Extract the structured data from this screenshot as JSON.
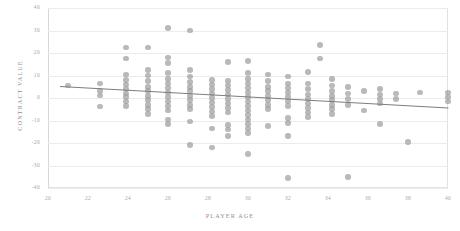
{
  "chart_data": {
    "type": "scatter",
    "title": "",
    "xlabel": "PLAYER AGE",
    "ylabel": "CONTRACT VALUE",
    "xlim": [
      20,
      40
    ],
    "ylim": [
      -40,
      40
    ],
    "xticks": [
      20,
      22,
      24,
      26,
      28,
      30,
      32,
      34,
      36,
      38,
      40
    ],
    "yticks": [
      40,
      30,
      20,
      10,
      0,
      -10,
      -20,
      -30,
      -40
    ],
    "grid": true,
    "legend": "none",
    "marker_color": "#9e9e9e",
    "trendline_color": "#7d7d7d",
    "gridline_color": "#ececec",
    "trendline": {
      "x0": 20.6,
      "y0": 5.2,
      "x1": 40.0,
      "y1": -4.4
    },
    "points": [
      [
        21.0,
        5.5
      ],
      [
        22.6,
        6.5
      ],
      [
        22.6,
        3.2
      ],
      [
        22.6,
        1.2
      ],
      [
        22.6,
        -3.8
      ],
      [
        23.9,
        22.5
      ],
      [
        23.9,
        17.5
      ],
      [
        23.9,
        10.5
      ],
      [
        23.9,
        8.0
      ],
      [
        23.9,
        6.0
      ],
      [
        23.9,
        4.0
      ],
      [
        23.9,
        2.0
      ],
      [
        23.9,
        0.5
      ],
      [
        23.9,
        -1.5
      ],
      [
        23.9,
        -3.5
      ],
      [
        25.0,
        22.5
      ],
      [
        25.0,
        12.5
      ],
      [
        25.0,
        10.0
      ],
      [
        25.0,
        7.5
      ],
      [
        25.0,
        5.0
      ],
      [
        25.0,
        3.0
      ],
      [
        25.0,
        1.0
      ],
      [
        25.0,
        -1.0
      ],
      [
        25.0,
        -3.0
      ],
      [
        25.0,
        -5.0
      ],
      [
        25.0,
        -7.0
      ],
      [
        26.0,
        31.0
      ],
      [
        26.0,
        18.0
      ],
      [
        26.0,
        15.5
      ],
      [
        26.0,
        11.0
      ],
      [
        26.0,
        8.5
      ],
      [
        26.0,
        6.5
      ],
      [
        26.0,
        4.5
      ],
      [
        26.0,
        2.5
      ],
      [
        26.0,
        0.5
      ],
      [
        26.0,
        -1.5
      ],
      [
        26.0,
        -3.5
      ],
      [
        26.0,
        -5.5
      ],
      [
        26.0,
        -9.5
      ],
      [
        26.0,
        -11.5
      ],
      [
        27.1,
        30.0
      ],
      [
        27.1,
        12.5
      ],
      [
        27.1,
        9.5
      ],
      [
        27.1,
        7.0
      ],
      [
        27.1,
        5.0
      ],
      [
        27.1,
        3.0
      ],
      [
        27.1,
        1.0
      ],
      [
        27.1,
        -1.0
      ],
      [
        27.1,
        -3.0
      ],
      [
        27.1,
        -5.0
      ],
      [
        27.1,
        -10.5
      ],
      [
        27.1,
        -21.0
      ],
      [
        28.2,
        8.0
      ],
      [
        28.2,
        6.0
      ],
      [
        28.2,
        4.0
      ],
      [
        28.2,
        2.0
      ],
      [
        28.2,
        0.0
      ],
      [
        28.2,
        -2.0
      ],
      [
        28.2,
        -4.0
      ],
      [
        28.2,
        -6.0
      ],
      [
        28.2,
        -8.0
      ],
      [
        28.2,
        -13.5
      ],
      [
        28.2,
        -22.0
      ],
      [
        29.0,
        16.0
      ],
      [
        29.0,
        7.5
      ],
      [
        29.0,
        5.5
      ],
      [
        29.0,
        3.5
      ],
      [
        29.0,
        1.5
      ],
      [
        29.0,
        -0.5
      ],
      [
        29.0,
        -2.5
      ],
      [
        29.0,
        -4.5
      ],
      [
        29.0,
        -6.5
      ],
      [
        29.0,
        -12.0
      ],
      [
        29.0,
        -14.0
      ],
      [
        29.0,
        -17.0
      ],
      [
        30.0,
        16.5
      ],
      [
        30.0,
        11.0
      ],
      [
        30.0,
        8.5
      ],
      [
        30.0,
        6.5
      ],
      [
        30.0,
        4.5
      ],
      [
        30.0,
        2.5
      ],
      [
        30.0,
        0.5
      ],
      [
        30.0,
        -1.5
      ],
      [
        30.0,
        -3.5
      ],
      [
        30.0,
        -5.5
      ],
      [
        30.0,
        -7.5
      ],
      [
        30.0,
        -9.5
      ],
      [
        30.0,
        -11.5
      ],
      [
        30.0,
        -13.5
      ],
      [
        30.0,
        -15.5
      ],
      [
        30.0,
        -25.0
      ],
      [
        31.0,
        10.5
      ],
      [
        31.0,
        7.5
      ],
      [
        31.0,
        5.0
      ],
      [
        31.0,
        3.0
      ],
      [
        31.0,
        1.0
      ],
      [
        31.0,
        -1.0
      ],
      [
        31.0,
        -3.0
      ],
      [
        31.0,
        -5.0
      ],
      [
        31.0,
        -12.5
      ],
      [
        32.0,
        9.5
      ],
      [
        32.0,
        6.5
      ],
      [
        32.0,
        4.5
      ],
      [
        32.0,
        2.5
      ],
      [
        32.0,
        0.5
      ],
      [
        32.0,
        -1.5
      ],
      [
        32.0,
        -3.5
      ],
      [
        32.0,
        -9.0
      ],
      [
        32.0,
        -11.0
      ],
      [
        32.0,
        -17.0
      ],
      [
        32.0,
        -35.5
      ],
      [
        33.0,
        11.5
      ],
      [
        33.0,
        6.5
      ],
      [
        33.0,
        4.0
      ],
      [
        33.0,
        1.5
      ],
      [
        33.0,
        -0.5
      ],
      [
        33.0,
        -2.5
      ],
      [
        33.0,
        -4.5
      ],
      [
        33.0,
        -6.5
      ],
      [
        33.0,
        -8.5
      ],
      [
        33.6,
        23.5
      ],
      [
        33.6,
        17.5
      ],
      [
        34.2,
        8.5
      ],
      [
        34.2,
        5.5
      ],
      [
        34.2,
        3.0
      ],
      [
        34.2,
        1.0
      ],
      [
        34.2,
        -1.0
      ],
      [
        34.2,
        -3.0
      ],
      [
        34.2,
        -5.0
      ],
      [
        34.2,
        -7.0
      ],
      [
        35.0,
        5.0
      ],
      [
        35.0,
        2.0
      ],
      [
        35.0,
        -0.5
      ],
      [
        35.0,
        -3.0
      ],
      [
        35.0,
        -35.0
      ],
      [
        35.8,
        3.0
      ],
      [
        35.8,
        -5.5
      ],
      [
        36.6,
        4.0
      ],
      [
        36.6,
        1.5
      ],
      [
        36.6,
        -0.5
      ],
      [
        36.6,
        -2.5
      ],
      [
        36.6,
        -11.5
      ],
      [
        37.4,
        2.0
      ],
      [
        37.4,
        -0.5
      ],
      [
        38.0,
        -19.5
      ],
      [
        38.6,
        2.5
      ],
      [
        40.0,
        2.5
      ],
      [
        40.0,
        0.5
      ],
      [
        40.0,
        -1.5
      ]
    ]
  }
}
